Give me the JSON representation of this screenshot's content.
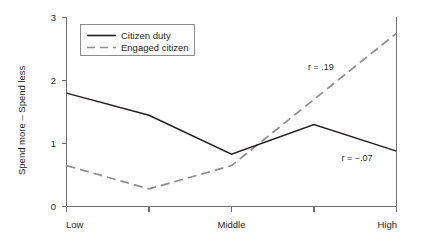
{
  "chart_data": {
    "type": "line",
    "title": "",
    "xlabel": "",
    "ylabel": "Spend more – Spend less",
    "categories": [
      "Low",
      "",
      "Middle",
      "",
      "High"
    ],
    "xtick_labels": [
      "Low",
      "Middle",
      "High"
    ],
    "ytick_labels": [
      "0",
      "1",
      "2",
      "3"
    ],
    "ylim": [
      0,
      3
    ],
    "yticks": [
      0,
      1,
      2,
      3
    ],
    "grid": false,
    "legend_position": "top-left",
    "series": [
      {
        "name": "Citizen duty",
        "style": "solid",
        "color": "#231f20",
        "values": [
          1.8,
          1.45,
          0.83,
          1.3,
          0.88
        ]
      },
      {
        "name": "Engaged citizen",
        "style": "dashed",
        "color": "#8a8c8e",
        "values": [
          0.65,
          0.28,
          0.65,
          1.7,
          2.75
        ]
      }
    ],
    "annotations": [
      {
        "text": "r = .19",
        "series": "Engaged citizen",
        "value": 0.19
      },
      {
        "text": "r = −.07",
        "series": "Citizen duty",
        "value": -0.07
      }
    ]
  },
  "axis": {
    "y_title": "Spend more – Spend less",
    "y_ticks": {
      "t0": "0",
      "t1": "1",
      "t2": "2",
      "t3": "3"
    },
    "x_ticks": {
      "low": "Low",
      "middle": "Middle",
      "high": "High"
    }
  },
  "legend": {
    "items": [
      {
        "label": "Citizen duty"
      },
      {
        "label": "Engaged citizen"
      }
    ]
  },
  "annotations": {
    "engaged": "r = .19",
    "duty": "r = −.07"
  }
}
